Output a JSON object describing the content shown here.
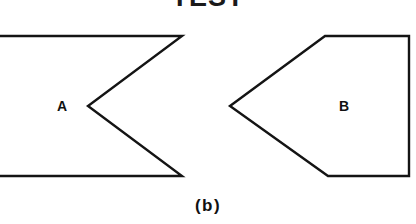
{
  "figure": {
    "title": "TEST",
    "caption": "(b)",
    "background_color": "#ffffff",
    "stroke_color": "#141414",
    "text_color": "#111111",
    "width": 416,
    "height": 224
  },
  "shapes": [
    {
      "label": "A",
      "name": "concave-chevron-shape",
      "description": "Left shape: rectangle-like band clipped at the left image edge with a V-shaped notch cut into its right side (concave arrow tail).",
      "points": "-10,36 182,36 88,106 182,176 -10,176",
      "label_x": 62,
      "label_y": 106
    },
    {
      "label": "B",
      "name": "convex-pentagon-shape",
      "description": "Right shape: pentagon pointing left (convex arrowhead) with a vertical right edge.",
      "points": "230,106 325,36 409,36 409,176 328,176",
      "label_x": 344,
      "label_y": 106
    }
  ]
}
